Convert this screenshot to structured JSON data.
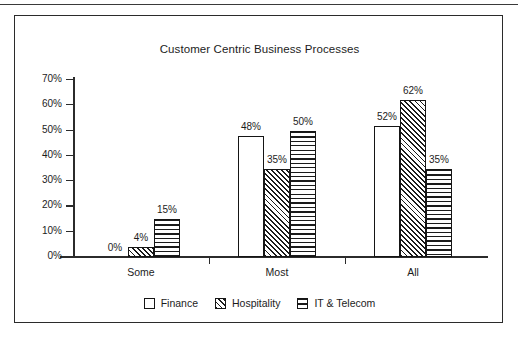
{
  "chart_data": {
    "type": "bar",
    "title": "Customer Centric Business Processes",
    "xlabel": "",
    "ylabel": "",
    "ylim": [
      0,
      70
    ],
    "grid": false,
    "legend_position": "bottom",
    "categories": [
      "Some",
      "Most",
      "All"
    ],
    "ytick_labels": [
      "0%",
      "10%",
      "20%",
      "30%",
      "40%",
      "50%",
      "60%",
      "70%"
    ],
    "ytick_values": [
      0,
      10,
      20,
      30,
      40,
      50,
      60,
      70
    ],
    "series": [
      {
        "name": "Finance",
        "pattern": "solid-white",
        "values": [
          0,
          48,
          52
        ],
        "labels": [
          "0%",
          "48%",
          "52%"
        ]
      },
      {
        "name": "Hospitality",
        "pattern": "diagonal-hatch",
        "values": [
          4,
          35,
          62
        ],
        "labels": [
          "4%",
          "35%",
          "62%"
        ]
      },
      {
        "name": "IT & Telecom",
        "pattern": "horizontal-lines",
        "values": [
          15,
          50,
          35
        ],
        "labels": [
          "15%",
          "50%",
          "35%"
        ]
      }
    ],
    "colors": {
      "ink": "#151515",
      "background": "#ffffff",
      "axis": "#2b2b2b"
    }
  }
}
